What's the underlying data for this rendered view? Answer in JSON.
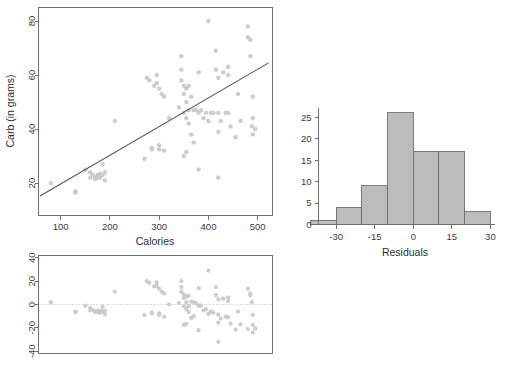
{
  "figure": {
    "title": "",
    "background": "#ffffff",
    "point_color": "#cfcfcf",
    "line_color": "#555555",
    "bar_fill": "#bcbcbc",
    "bar_stroke": "#6f6f6f",
    "axis_color": "#707070"
  },
  "chart_data": [
    {
      "id": "scatter-calories-carb",
      "type": "scatter",
      "title": "",
      "xlabel": "Calories",
      "ylabel": "Carb (in grams)",
      "xlim": [
        55,
        530
      ],
      "ylim": [
        8,
        85
      ],
      "xticks": [
        100,
        200,
        300,
        400,
        500
      ],
      "yticks": [
        20,
        40,
        60,
        80
      ],
      "xtick_labels": [
        "100",
        "200",
        "300",
        "400",
        "500"
      ],
      "ytick_labels": [
        "20",
        "40",
        "60",
        "80"
      ],
      "grid": false,
      "legend": "none",
      "fit_line": {
        "label": "least-squares regression line",
        "x_start": 58,
        "y_start": 15.2,
        "x_end": 522,
        "y_end": 64.5
      },
      "x": [
        80,
        130,
        130,
        150,
        160,
        160,
        165,
        170,
        170,
        175,
        175,
        180,
        180,
        185,
        185,
        190,
        190,
        210,
        270,
        275,
        280,
        285,
        285,
        290,
        295,
        295,
        300,
        300,
        300,
        305,
        310,
        310,
        320,
        340,
        345,
        345,
        345,
        350,
        350,
        350,
        350,
        355,
        355,
        355,
        355,
        360,
        360,
        360,
        365,
        365,
        370,
        370,
        375,
        380,
        380,
        380,
        385,
        390,
        395,
        400,
        400,
        405,
        410,
        415,
        415,
        420,
        420,
        420,
        420,
        425,
        430,
        435,
        440,
        440,
        440,
        445,
        455,
        460,
        465,
        480,
        480,
        485,
        485,
        488,
        490,
        490,
        490,
        495
      ],
      "y": [
        20,
        17,
        16.5,
        25,
        24,
        22,
        23,
        22,
        21.5,
        23,
        22,
        23.5,
        22,
        27,
        23,
        24,
        21,
        43,
        29,
        59,
        58,
        33,
        32.5,
        56,
        60,
        57,
        55,
        34,
        32.5,
        53,
        52,
        32,
        44,
        48,
        67,
        62,
        58,
        56,
        53,
        46,
        30,
        55,
        50,
        44,
        31.5,
        56,
        47,
        42,
        52,
        38,
        47,
        35,
        47,
        61,
        46,
        25,
        47,
        44,
        46,
        80,
        43,
        46,
        46,
        69,
        62,
        59,
        46,
        39,
        22,
        43,
        61,
        46,
        63,
        60,
        46,
        41,
        37,
        53,
        43,
        78,
        74,
        73,
        67,
        41,
        52,
        44,
        38,
        40
      ]
    },
    {
      "id": "residuals-vs-fitted",
      "type": "scatter",
      "title": "",
      "xlabel": "",
      "ylabel": "",
      "xlim": [
        55,
        530
      ],
      "ylim": [
        -42,
        42
      ],
      "xticks": [],
      "yticks": [
        -40,
        -20,
        0,
        20,
        40
      ],
      "ytick_labels": [
        "-40",
        "-20",
        "0",
        "20",
        "40"
      ],
      "grid": false,
      "legend": "none",
      "zero_line": 0,
      "x": [
        80,
        130,
        130,
        150,
        160,
        160,
        165,
        170,
        170,
        175,
        175,
        180,
        180,
        185,
        185,
        190,
        190,
        210,
        270,
        275,
        280,
        285,
        285,
        290,
        295,
        295,
        300,
        300,
        300,
        305,
        310,
        310,
        320,
        340,
        345,
        345,
        345,
        350,
        350,
        350,
        350,
        355,
        355,
        355,
        355,
        360,
        360,
        360,
        365,
        365,
        370,
        370,
        375,
        380,
        380,
        380,
        385,
        390,
        395,
        400,
        400,
        405,
        410,
        415,
        415,
        420,
        420,
        420,
        420,
        425,
        430,
        435,
        440,
        440,
        440,
        445,
        455,
        460,
        465,
        480,
        480,
        485,
        485,
        488,
        490,
        490,
        490,
        495
      ],
      "y": [
        2,
        -6,
        -6.5,
        -1,
        -3,
        -5,
        -4.5,
        -6,
        -6.5,
        -5.5,
        -6.5,
        -5.5,
        -7,
        -2,
        -6,
        -5.5,
        -8.5,
        11,
        -9,
        20,
        18.5,
        -7,
        -7.5,
        15.5,
        19,
        16,
        13.5,
        -7.5,
        -9,
        11,
        9.5,
        -10.5,
        0,
        1.5,
        20,
        15,
        11,
        8.5,
        5.5,
        -1.5,
        -17.5,
        7,
        2,
        -4,
        -16.5,
        7.5,
        -1.5,
        -6.5,
        2.5,
        -11.5,
        2,
        -10,
        1,
        14,
        -1,
        -22,
        -1,
        -5,
        -4,
        29,
        -8,
        -6,
        -7,
        15,
        8,
        4.5,
        -8.5,
        -15.5,
        -32,
        -12,
        5,
        -10.5,
        6,
        3,
        -11,
        -16.5,
        -21.5,
        -6,
        -17,
        -21,
        13.5,
        9.5,
        8,
        2,
        -24,
        -9,
        -17.5,
        -20.5,
        -19
      ]
    },
    {
      "id": "histogram-residuals",
      "type": "bar",
      "title": "",
      "xlabel": "Residuals",
      "ylabel": "",
      "xlim": [
        -40,
        32
      ],
      "ylim": [
        0,
        27
      ],
      "xticks": [
        -30,
        -15,
        0,
        15,
        30
      ],
      "yticks": [
        0,
        5,
        10,
        15,
        20,
        25
      ],
      "xtick_labels": [
        "-30",
        "-15",
        "0",
        "15",
        "30"
      ],
      "ytick_labels": [
        "0",
        "5",
        "10",
        "15",
        "20",
        "25"
      ],
      "grid": false,
      "legend": "none",
      "bin_edges": [
        -40,
        -30,
        -20,
        -10,
        0,
        10,
        20,
        30
      ],
      "bin_labels": [
        "-40 to -30",
        "-30 to -20",
        "-20 to -10",
        "-10 to 0",
        "0 to 10",
        "10 to 20",
        "20 to 30"
      ],
      "values": [
        1,
        4,
        9,
        26,
        17,
        17,
        3
      ]
    }
  ]
}
